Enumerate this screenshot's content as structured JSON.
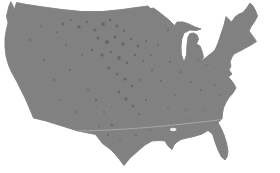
{
  "figure": {
    "type": "map-silhouette",
    "region": "Contiguous United States",
    "colors": {
      "land_fill": "#7e7e7e",
      "background": "#ffffff",
      "divider_line": "#b6b6b6",
      "speckle": "#3f3f3f"
    },
    "map": {
      "outline_path": "M11,2 L13,6 L14,10 L15.5,6 L16.5,2.5 L24,4 L40,6.5 L62,9.5 L82,11.5 L102,11.5 L122,9.5 L136,7.5 L148,6 L150.5,8.5 L153.5,8 L159,12 L164,16 L169,20 L174.5,25.5 L177,22 L183,22 L189,24 L195,27 L201,29 L196,30.5 L190,30 L184,33 L181.5,40 L181,48 L181.5,55 L184,62 L186.5,55 L187,45 L188,37 L190,33.5 L194,33 L197,35 L198.5,39 L196.5,44 L200,46 L202,51 L203.5,57 L201,61 L206,57.5 L211,53.5 L215,50 L218,43 L221,34 L224,25 L226,16.5 L228.5,19 L231.5,22 L235,17 L239,14 L243,12.5 L247,7.5 L250,3 L253,6 L255.5,10.5 L257.5,16 L255,21 L251.5,26 L249,31 L252,35 L254.5,38.5 L256.5,41.5 L251,45 L245.5,48 L240,51 L234,54 L232,57 L230,62 L231,66 L229,70 L232,74 L228.5,77 L231,80 L234,84 L236,88 L233,93 L229,97.5 L226,102.5 L223.5,108 L222.5,113.5 L222,119 L218,122.5 L221,128 L224,135 L226.5,143 L228,151 L227,157 L225,160 L221.5,157 L218,150 L215,142 L212.5,134 L208,130.5 L202,134 L194,136.5 L187,138 L181,139.5 L177,142 L174,145 L172,149.5 L168,146 L165,141 L160,140.5 L152,141 L145,145 L138,151 L130,158 L124,165.5 L119.5,159.5 L115,154 L110,149 L106.5,146.5 L102.5,143.5 L99,139 L95.5,134.5 L90.5,133.5 L85.5,132.5 L78,131 L70,128.5 L62,126 L54,123.5 L46,121 L40,119.5 L33.5,118 L31,112 L28.5,106 L25,98 L21,90 L16.5,81 L11.5,72 L8.5,65 L6,56 L5,47 L5,38 L6.5,29 L8,23 L6.5,16 L9,6 Z",
      "divider_path": "M78,131 C115,130.5 168,126.5 222,119.5",
      "inland_water_path": "M170,129.5 a3.2,1.7 0 1,0 6.4,0 a3.2,1.7 0 1,0 -6.4,0",
      "speckles": [
        {
          "x": 63,
          "y": 24,
          "r": 1.4
        },
        {
          "x": 71,
          "y": 20,
          "r": 1.1
        },
        {
          "x": 79,
          "y": 27,
          "r": 1.7
        },
        {
          "x": 87,
          "y": 22,
          "r": 1.2
        },
        {
          "x": 95,
          "y": 30,
          "r": 1.5
        },
        {
          "x": 103,
          "y": 24,
          "r": 1.9
        },
        {
          "x": 110,
          "y": 20,
          "r": 1.3
        },
        {
          "x": 117,
          "y": 26,
          "r": 1.5
        },
        {
          "x": 124,
          "y": 31,
          "r": 1.2
        },
        {
          "x": 98,
          "y": 38,
          "r": 1.6
        },
        {
          "x": 107,
          "y": 42,
          "r": 2.1
        },
        {
          "x": 115,
          "y": 37,
          "r": 1.4
        },
        {
          "x": 123,
          "y": 44,
          "r": 1.7
        },
        {
          "x": 131,
          "y": 39,
          "r": 1.3
        },
        {
          "x": 138,
          "y": 46,
          "r": 1.5
        },
        {
          "x": 146,
          "y": 41,
          "r": 1.1
        },
        {
          "x": 92,
          "y": 50,
          "r": 1.2
        },
        {
          "x": 102,
          "y": 55,
          "r": 1.7
        },
        {
          "x": 111,
          "y": 52,
          "r": 1.3
        },
        {
          "x": 119,
          "y": 58,
          "r": 1.9
        },
        {
          "x": 127,
          "y": 63,
          "r": 1.4
        },
        {
          "x": 135,
          "y": 55,
          "r": 1.2
        },
        {
          "x": 143,
          "y": 61,
          "r": 1.1
        },
        {
          "x": 151,
          "y": 55,
          "r": 1.0
        },
        {
          "x": 109,
          "y": 68,
          "r": 1.5
        },
        {
          "x": 117,
          "y": 74,
          "r": 1.3
        },
        {
          "x": 125,
          "y": 79,
          "r": 1.6
        },
        {
          "x": 132,
          "y": 86,
          "r": 1.2
        },
        {
          "x": 140,
          "y": 80,
          "r": 1.0
        },
        {
          "x": 119,
          "y": 92,
          "r": 1.4
        },
        {
          "x": 126,
          "y": 99,
          "r": 1.7
        },
        {
          "x": 133,
          "y": 106,
          "r": 1.3
        },
        {
          "x": 139,
          "y": 114,
          "r": 1.1
        },
        {
          "x": 146,
          "y": 100,
          "r": 1.0
        },
        {
          "x": 96,
          "y": 100,
          "r": 1.2
        },
        {
          "x": 104,
          "y": 112,
          "r": 1.1
        },
        {
          "x": 112,
          "y": 125,
          "r": 1.3
        },
        {
          "x": 152,
          "y": 70,
          "r": 1.0
        },
        {
          "x": 161,
          "y": 81,
          "r": 1.1
        },
        {
          "x": 170,
          "y": 62,
          "r": 0.9
        },
        {
          "x": 181,
          "y": 72,
          "r": 1.0
        },
        {
          "x": 191,
          "y": 82,
          "r": 0.9
        },
        {
          "x": 201,
          "y": 90,
          "r": 0.9
        },
        {
          "x": 210,
          "y": 72,
          "r": 0.8
        },
        {
          "x": 30,
          "y": 40,
          "r": 0.9
        },
        {
          "x": 44,
          "y": 60,
          "r": 1.0
        },
        {
          "x": 54,
          "y": 80,
          "r": 0.9
        },
        {
          "x": 41,
          "y": 26,
          "r": 0.8
        },
        {
          "x": 60,
          "y": 100,
          "r": 0.9
        },
        {
          "x": 76,
          "y": 112,
          "r": 0.9
        },
        {
          "x": 88,
          "y": 90,
          "r": 1.0
        },
        {
          "x": 70,
          "y": 70,
          "r": 1.0
        },
        {
          "x": 82,
          "y": 55,
          "r": 0.9
        },
        {
          "x": 66,
          "y": 45,
          "r": 1.0
        },
        {
          "x": 57,
          "y": 32,
          "r": 1.0
        },
        {
          "x": 160,
          "y": 120,
          "r": 0.8
        },
        {
          "x": 186,
          "y": 110,
          "r": 0.8
        },
        {
          "x": 190,
          "y": 120,
          "r": 0.7
        },
        {
          "x": 205,
          "y": 110,
          "r": 0.7
        },
        {
          "x": 150,
          "y": 130,
          "r": 0.8
        },
        {
          "x": 136,
          "y": 135,
          "r": 0.9
        },
        {
          "x": 120,
          "y": 140,
          "r": 0.8
        },
        {
          "x": 108,
          "y": 135,
          "r": 0.9
        },
        {
          "x": 99,
          "y": 127,
          "r": 0.8
        },
        {
          "x": 168,
          "y": 30,
          "r": 0.9
        },
        {
          "x": 158,
          "y": 45,
          "r": 0.9
        },
        {
          "x": 215,
          "y": 85,
          "r": 0.8
        },
        {
          "x": 220,
          "y": 95,
          "r": 0.7
        },
        {
          "x": 198,
          "y": 60,
          "r": 0.8
        },
        {
          "x": 206,
          "y": 65,
          "r": 0.7
        },
        {
          "x": 175,
          "y": 95,
          "r": 0.8
        },
        {
          "x": 168,
          "y": 108,
          "r": 0.8
        }
      ]
    }
  }
}
